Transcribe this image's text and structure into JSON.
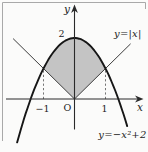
{
  "labels": {
    "y_axis_label": "y",
    "x_axis_label": "x",
    "origin_label": "O",
    "tick_2": "2",
    "tick_neg1": "−1",
    "tick_1": "1",
    "abs_label": "y=|x|",
    "parabola_label": "y=−x²+2"
  },
  "colors": {
    "background": "#fbfbfa",
    "parabola_curve": "#161616",
    "abs_line": "#3d3d3d",
    "axis": "#2a2a2a",
    "shade_fill": "#c4c4c4",
    "frame_border": "#a9a9a9",
    "dashed_guide": "#666666",
    "text": "#222222"
  },
  "chart_data": {
    "type": "line",
    "series": [
      {
        "name": "y=|x|",
        "function": "abs(x)",
        "domain": [
          -1.98,
          1.81
        ],
        "style": "thin-black-line"
      },
      {
        "name": "y=−x²+2",
        "function": "2-x^2",
        "domain": [
          -1.85,
          1.7
        ],
        "style": "thick-black-curve"
      }
    ],
    "intersections": [
      {
        "x": -1,
        "y": 1
      },
      {
        "x": 1,
        "y": 1
      }
    ],
    "x_ticks": [
      {
        "value": -1,
        "label": "−1"
      },
      {
        "value": 1,
        "label": "1"
      }
    ],
    "y_ticks": [
      {
        "value": 2,
        "label": "2"
      }
    ],
    "origin": {
      "label": "O",
      "x": 0,
      "y": 0
    },
    "guides": [
      {
        "type": "dashed",
        "from": {
          "x": -1,
          "y": 0
        },
        "to": {
          "x": -1,
          "y": 1
        }
      },
      {
        "type": "dashed",
        "from": {
          "x": 1,
          "y": 0
        },
        "to": {
          "x": 1,
          "y": 1
        }
      }
    ],
    "shaded_region": {
      "upper": "y=−x²+2",
      "lower": "y=|x|",
      "x_range": [
        -1,
        1
      ],
      "fill": "#c4c4c4"
    },
    "axis_range": {
      "x": [
        -2.2,
        2.15
      ],
      "y": [
        -1.45,
        3.05
      ]
    },
    "grid": false,
    "legend": "inline-labels"
  }
}
